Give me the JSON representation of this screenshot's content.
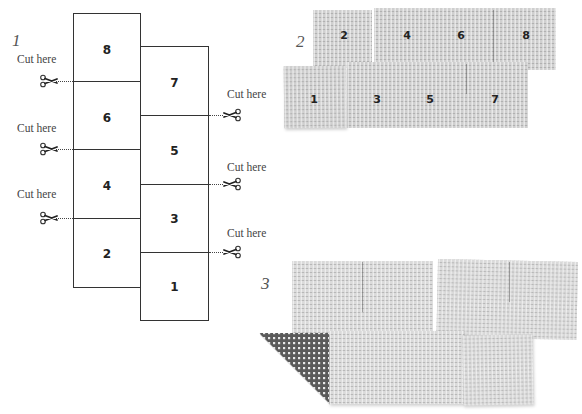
{
  "steps": [
    {
      "number": "1",
      "label": "step-1-cutting-diagram"
    },
    {
      "number": "2",
      "label": "step-2-rearranged-pieces"
    },
    {
      "number": "3",
      "label": "step-3-folded-assembly"
    }
  ],
  "step1": {
    "cut_label": "Cut here",
    "left_column": [
      "8",
      "6",
      "4",
      "2"
    ],
    "right_column": [
      "7",
      "5",
      "3",
      "1"
    ],
    "left_cuts": [
      {
        "label": "Cut here",
        "between": [
          "8",
          "6"
        ]
      },
      {
        "label": "Cut here",
        "between": [
          "6",
          "4"
        ]
      },
      {
        "label": "Cut here",
        "between": [
          "4",
          "2"
        ]
      }
    ],
    "right_cuts": [
      {
        "label": "Cut here",
        "between": [
          "7",
          "5"
        ]
      },
      {
        "label": "Cut here",
        "between": [
          "5",
          "3"
        ]
      },
      {
        "label": "Cut here",
        "between": [
          "3",
          "1"
        ]
      }
    ]
  },
  "step2": {
    "top_row": [
      "2",
      "4",
      "6",
      "8"
    ],
    "bottom_row": [
      "1",
      "3",
      "5",
      "7"
    ]
  },
  "colors": {
    "line": "#333333",
    "text": "#444444",
    "weave_light": "#cfcfcf",
    "weave_dark": "#5a5a5a",
    "background": "#ffffff"
  }
}
